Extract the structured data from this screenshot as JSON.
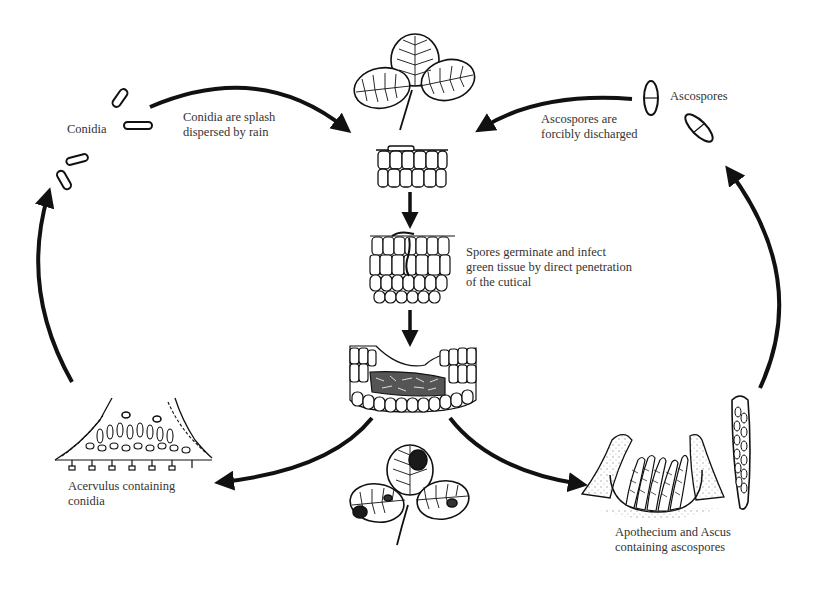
{
  "diagram": {
    "type": "life-cycle",
    "colors": {
      "ink": "#1a1a1a",
      "text": "#333333",
      "background": "#ffffff",
      "stipple": "#9a9a9a"
    },
    "labels": {
      "conidia": "Conidia",
      "splash_line1": "Conidia are splash",
      "splash_line2": "dispersed by rain",
      "ascospores": "Ascospores",
      "discharge_line1": "Ascospores are",
      "discharge_line2": "forcibly discharged",
      "germinate_line1": "Spores germinate and infect",
      "germinate_line2": "green tissue by direct penetration",
      "germinate_line3": "of the cutical",
      "acervulus_line1": "Acervulus containing",
      "acervulus_line2": "conidia",
      "apothecium_line1": "Apothecium and Ascus",
      "apothecium_line2": "containing ascospores"
    },
    "stages": [
      {
        "id": "healthy-leaf",
        "description": "Healthy trifoliate clover leaf"
      },
      {
        "id": "spore-on-cuticle",
        "description": "Spore landing on leaf epidermis"
      },
      {
        "id": "germination",
        "description": "Spore germinating and penetrating tissue"
      },
      {
        "id": "infected-tissue",
        "description": "Collapsed infected tissue section"
      },
      {
        "id": "diseased-leaf",
        "description": "Diseased clover leaf with dark lesions"
      },
      {
        "id": "acervulus",
        "description": "Acervulus producing conidia"
      },
      {
        "id": "apothecium",
        "description": "Apothecium with asci"
      },
      {
        "id": "conidia",
        "description": "Free conidia"
      },
      {
        "id": "ascospores",
        "description": "Free ascospores"
      }
    ],
    "arrows": [
      {
        "from": "conidia",
        "to": "spore-on-cuticle"
      },
      {
        "from": "ascospores",
        "to": "spore-on-cuticle"
      },
      {
        "from": "spore-on-cuticle",
        "to": "germination"
      },
      {
        "from": "germination",
        "to": "infected-tissue"
      },
      {
        "from": "infected-tissue",
        "to": "acervulus"
      },
      {
        "from": "infected-tissue",
        "to": "apothecium"
      },
      {
        "from": "acervulus",
        "to": "conidia"
      },
      {
        "from": "apothecium",
        "to": "ascospores"
      }
    ]
  }
}
